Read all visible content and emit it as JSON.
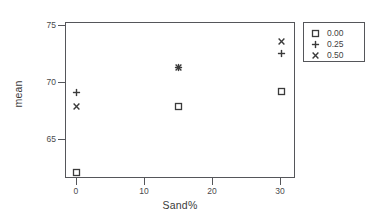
{
  "chart_data": {
    "type": "scatter",
    "title": "",
    "xlabel": "Sand%",
    "ylabel": "mean",
    "xlim": [
      -1.6,
      32.2
    ],
    "ylim": [
      61.6,
      75.3
    ],
    "grid": false,
    "legend_position": "right-outside",
    "legend_title": "",
    "x": [
      0,
      15,
      30
    ],
    "xticks": [
      "0",
      "10",
      "20",
      "30"
    ],
    "xtick_values": [
      0,
      10,
      20,
      30
    ],
    "yticks": [
      "75",
      "70",
      "65"
    ],
    "ytick_values": [
      75,
      70,
      65
    ],
    "series": [
      {
        "name": "0.00",
        "marker": "open-square",
        "color": "#3a3a3a",
        "values": [
          62.2,
          68.0,
          69.3
        ],
        "points": [
          {
            "x": 0,
            "y": 62.2
          },
          {
            "x": 15,
            "y": 68.0
          },
          {
            "x": 30,
            "y": 69.3
          }
        ]
      },
      {
        "name": "0.25",
        "marker": "plus",
        "color": "#3a3a3a",
        "values": [
          69.2,
          71.4,
          72.6
        ],
        "points": [
          {
            "x": 0,
            "y": 69.2
          },
          {
            "x": 15,
            "y": 71.4
          },
          {
            "x": 30,
            "y": 72.6
          }
        ]
      },
      {
        "name": "0.50",
        "marker": "cross",
        "color": "#3a3a3a",
        "values": [
          68.0,
          71.4,
          73.7
        ],
        "points": [
          {
            "x": 0,
            "y": 68.0
          },
          {
            "x": 15,
            "y": 71.4
          },
          {
            "x": 30,
            "y": 73.7
          }
        ]
      }
    ]
  },
  "legend": {
    "entries": [
      {
        "label": "0.00",
        "marker": "open-square"
      },
      {
        "label": "0.25",
        "marker": "plus"
      },
      {
        "label": "0.50",
        "marker": "cross"
      }
    ]
  },
  "axes": {
    "x_title": "Sand%",
    "y_title": "mean"
  }
}
